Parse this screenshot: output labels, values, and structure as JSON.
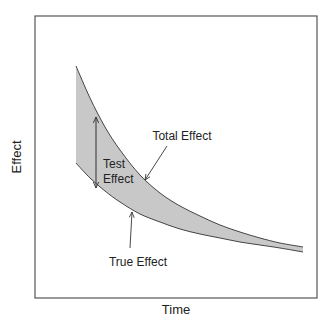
{
  "chart_data": {
    "type": "area",
    "title": "",
    "xlabel": "Time",
    "ylabel": "Effect",
    "grid": false,
    "legend": null,
    "axis_ticks": false,
    "series": [
      {
        "name": "Total Effect",
        "role": "upper-curve",
        "points_px": [
          [
            76,
            66
          ],
          [
            90,
            98
          ],
          [
            105,
            127
          ],
          [
            120,
            150
          ],
          [
            140,
            175
          ],
          [
            160,
            193
          ],
          [
            180,
            206
          ],
          [
            200,
            216
          ],
          [
            220,
            225
          ],
          [
            240,
            232
          ],
          [
            260,
            238
          ],
          [
            280,
            243
          ],
          [
            303,
            247
          ]
        ]
      },
      {
        "name": "True Effect",
        "role": "lower-curve",
        "points_px": [
          [
            76,
            163
          ],
          [
            90,
            178
          ],
          [
            105,
            191
          ],
          [
            120,
            202
          ],
          [
            140,
            214
          ],
          [
            160,
            222
          ],
          [
            180,
            229
          ],
          [
            200,
            234
          ],
          [
            220,
            238
          ],
          [
            240,
            242
          ],
          [
            260,
            245
          ],
          [
            280,
            248
          ],
          [
            303,
            252
          ]
        ]
      }
    ],
    "shaded_region": {
      "between": [
        "Total Effect",
        "True Effect"
      ],
      "color": "#c8c8c8"
    },
    "annotations": [
      {
        "text": "Total Effect",
        "label_x": 182,
        "label_y": 140,
        "arrow_from": [
          167,
          146
        ],
        "arrow_to": [
          145,
          180
        ]
      },
      {
        "text": "True Effect",
        "label_x": 138,
        "label_y": 266,
        "arrow_from": [
          130,
          248
        ],
        "arrow_to": [
          132,
          212
        ]
      },
      {
        "text_lines": [
          "Test",
          "Effect"
        ],
        "label_x": 103,
        "label_y": 168,
        "double_arrow": {
          "x": 96,
          "y1": 117,
          "y2": 188
        }
      }
    ]
  },
  "labels": {
    "xlabel": "Time",
    "ylabel": "Effect",
    "total_effect": "Total Effect",
    "true_effect": "True Effect",
    "test_line1": "Test",
    "test_line2": "Effect"
  },
  "colors": {
    "frame": "#555555",
    "curve": "#444444",
    "fill": "#c8c8c8",
    "text": "#222222"
  }
}
